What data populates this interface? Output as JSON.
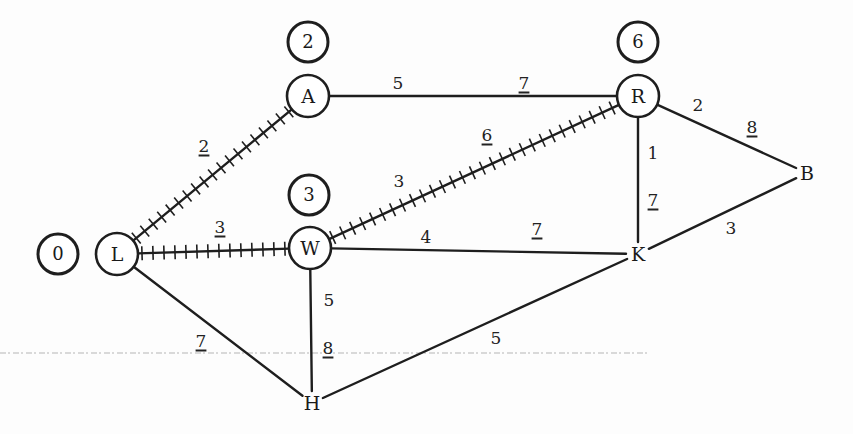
{
  "diagram": {
    "type": "weighted-graph-shortest-path",
    "colors": {
      "ink": "#1e1e1e",
      "paper": "#fdfdfd",
      "dashed_line": "#9a9a9a"
    },
    "nodes": [
      {
        "id": "L",
        "label": "L",
        "x": 117,
        "y": 254,
        "circled": true
      },
      {
        "id": "A",
        "label": "A",
        "x": 308,
        "y": 96,
        "circled": true
      },
      {
        "id": "W",
        "label": "W",
        "x": 310,
        "y": 248,
        "circled": true
      },
      {
        "id": "R",
        "label": "R",
        "x": 638,
        "y": 96,
        "circled": true
      },
      {
        "id": "B",
        "label": "B",
        "x": 807,
        "y": 173,
        "circled": false
      },
      {
        "id": "K",
        "label": "K",
        "x": 638,
        "y": 254,
        "circled": false
      },
      {
        "id": "H",
        "label": "H",
        "x": 312,
        "y": 403,
        "circled": false
      }
    ],
    "distance_labels": [
      {
        "node": "L",
        "value": "0",
        "x": 58,
        "y": 254
      },
      {
        "node": "A",
        "value": "2",
        "x": 308,
        "y": 42
      },
      {
        "node": "W",
        "value": "3",
        "x": 309,
        "y": 195
      },
      {
        "node": "R",
        "value": "6",
        "x": 638,
        "y": 42
      }
    ],
    "edges": [
      {
        "from": "L",
        "to": "A",
        "weight": "2",
        "tree_edge": true,
        "labels": [
          {
            "text": "2",
            "underlined": true,
            "x": 204,
            "y": 146
          }
        ]
      },
      {
        "from": "L",
        "to": "W",
        "weight": "3",
        "tree_edge": true,
        "labels": [
          {
            "text": "3",
            "underlined": true,
            "x": 220,
            "y": 227
          }
        ]
      },
      {
        "from": "W",
        "to": "R",
        "weight": "3",
        "tree_edge": true,
        "labels": [
          {
            "text": "3",
            "underlined": false,
            "x": 399,
            "y": 181
          },
          {
            "text": "6",
            "underlined": true,
            "x": 487,
            "y": 135
          }
        ]
      },
      {
        "from": "A",
        "to": "R",
        "weight": "5",
        "tree_edge": false,
        "labels": [
          {
            "text": "5",
            "underlined": false,
            "x": 398,
            "y": 83
          },
          {
            "text": "7",
            "underlined": true,
            "x": 524,
            "y": 83
          }
        ]
      },
      {
        "from": "W",
        "to": "K",
        "weight": "4",
        "tree_edge": false,
        "labels": [
          {
            "text": "4",
            "underlined": false,
            "x": 426,
            "y": 237
          },
          {
            "text": "7",
            "underlined": true,
            "x": 537,
            "y": 229
          }
        ]
      },
      {
        "from": "R",
        "to": "B",
        "weight": "2",
        "tree_edge": false,
        "labels": [
          {
            "text": "2",
            "underlined": false,
            "x": 698,
            "y": 105
          },
          {
            "text": "8",
            "underlined": true,
            "x": 752,
            "y": 127
          }
        ]
      },
      {
        "from": "R",
        "to": "K",
        "weight": "1",
        "tree_edge": false,
        "labels": [
          {
            "text": "1",
            "underlined": false,
            "x": 653,
            "y": 153
          },
          {
            "text": "7",
            "underlined": true,
            "x": 653,
            "y": 200
          }
        ]
      },
      {
        "from": "K",
        "to": "B",
        "weight": "3",
        "tree_edge": false,
        "labels": [
          {
            "text": "3",
            "underlined": false,
            "x": 731,
            "y": 228
          }
        ]
      },
      {
        "from": "W",
        "to": "H",
        "weight": "5",
        "tree_edge": false,
        "labels": [
          {
            "text": "5",
            "underlined": false,
            "x": 329,
            "y": 300
          },
          {
            "text": "8",
            "underlined": true,
            "x": 328,
            "y": 348
          }
        ]
      },
      {
        "from": "L",
        "to": "H",
        "weight": "7",
        "tree_edge": false,
        "labels": [
          {
            "text": "7",
            "underlined": true,
            "x": 201,
            "y": 341
          }
        ]
      },
      {
        "from": "H",
        "to": "K",
        "weight": "5",
        "tree_edge": false,
        "labels": [
          {
            "text": "5",
            "underlined": false,
            "x": 496,
            "y": 338
          }
        ]
      }
    ],
    "scan_artifact": {
      "dashed_line_y": 353,
      "x_start": 0,
      "x_end": 650
    }
  }
}
